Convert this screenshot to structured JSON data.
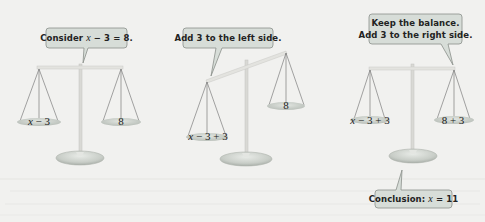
{
  "figure": {
    "colors": {
      "background": "#f1f1ef",
      "bubble_fill": "#d7ddd8",
      "bubble_stroke": "#8a8f8a",
      "beam": "#e0e0dc",
      "pan": "#c9cec9",
      "rope": "#7a7a7a",
      "pole": "#d8d8d4",
      "base": "#cfd3ce",
      "text": "#222222"
    },
    "panels": [
      {
        "id": "step-1",
        "bubble": {
          "prefix": "Consider ",
          "var": "x",
          "suffix": " − 3 = 8."
        },
        "left_pan": {
          "var": "x",
          "rest": " − 3"
        },
        "right_pan": {
          "label": "8"
        },
        "balanced": true
      },
      {
        "id": "step-2",
        "bubble": {
          "text": "Add 3 to the left side."
        },
        "left_pan": {
          "var": "x",
          "rest": " − 3 + 3"
        },
        "right_pan": {
          "label": "8"
        },
        "balanced": false
      },
      {
        "id": "step-3",
        "bubble": {
          "line1": "Keep the balance.",
          "line2": "Add 3 to the right side."
        },
        "left_pan": {
          "var": "x",
          "rest": " − 3 + 3"
        },
        "right_pan": {
          "label": "8 + 3"
        },
        "balanced": true,
        "conclusion": {
          "prefix": "Conclusion: ",
          "var": "x",
          "suffix": " = 11"
        }
      }
    ]
  }
}
